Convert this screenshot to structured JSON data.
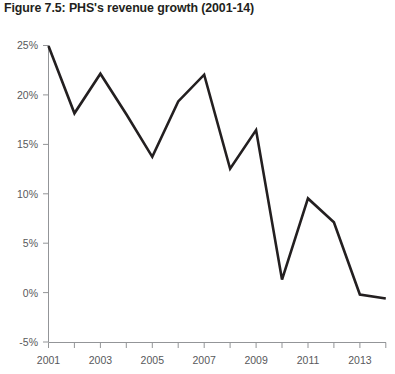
{
  "figure": {
    "title": "Figure 7.5: PHS's revenue growth (2001-14)"
  },
  "colors": {
    "line": "#231f20",
    "axis": "#939598",
    "tick_label": "#58595b",
    "title": "#231f20",
    "background": "#ffffff"
  },
  "axes": {
    "y_tick_labels": [
      "25%",
      "20%",
      "15%",
      "10%",
      "5%",
      "0%",
      "-5%"
    ],
    "x_tick_labels": [
      "2001",
      "2003",
      "2005",
      "2007",
      "2009",
      "2011",
      "2013"
    ]
  },
  "chart_data": {
    "type": "line",
    "title": "Figure 7.5: PHS's revenue growth (2001-14)",
    "xlabel": "",
    "ylabel": "",
    "x": [
      2001,
      2002,
      2003,
      2004,
      2005,
      2006,
      2007,
      2008,
      2009,
      2010,
      2011,
      2012,
      2013,
      2014
    ],
    "categories": [
      "2001",
      "2002",
      "2003",
      "2004",
      "2005",
      "2006",
      "2007",
      "2008",
      "2009",
      "2010",
      "2011",
      "2012",
      "2013",
      "2014"
    ],
    "values": [
      24.9,
      18.1,
      22.1,
      18.0,
      13.7,
      19.3,
      22.0,
      12.5,
      16.4,
      1.3,
      9.5,
      7.1,
      -0.2,
      -0.6
    ],
    "series": [
      {
        "name": "PHS revenue growth",
        "values": [
          24.9,
          18.1,
          22.1,
          18.0,
          13.7,
          19.3,
          22.0,
          12.5,
          16.4,
          1.3,
          9.5,
          7.1,
          -0.2,
          -0.6
        ]
      }
    ],
    "ylim": [
      -5,
      25
    ],
    "xlim": [
      2001,
      2014
    ],
    "y_ticks": [
      25,
      20,
      15,
      10,
      5,
      0,
      -5
    ],
    "y_tick_labels": [
      "25%",
      "20%",
      "15%",
      "10%",
      "5%",
      "0%",
      "-5%"
    ],
    "x_ticks": [
      2001,
      2002,
      2003,
      2004,
      2005,
      2006,
      2007,
      2008,
      2009,
      2010,
      2011,
      2012,
      2013,
      2014
    ],
    "x_tick_labels": [
      "2001",
      "",
      "2003",
      "",
      "2005",
      "",
      "2007",
      "",
      "2009",
      "",
      "2011",
      "",
      "2013",
      ""
    ],
    "grid": false,
    "legend": false,
    "units": "percent"
  }
}
